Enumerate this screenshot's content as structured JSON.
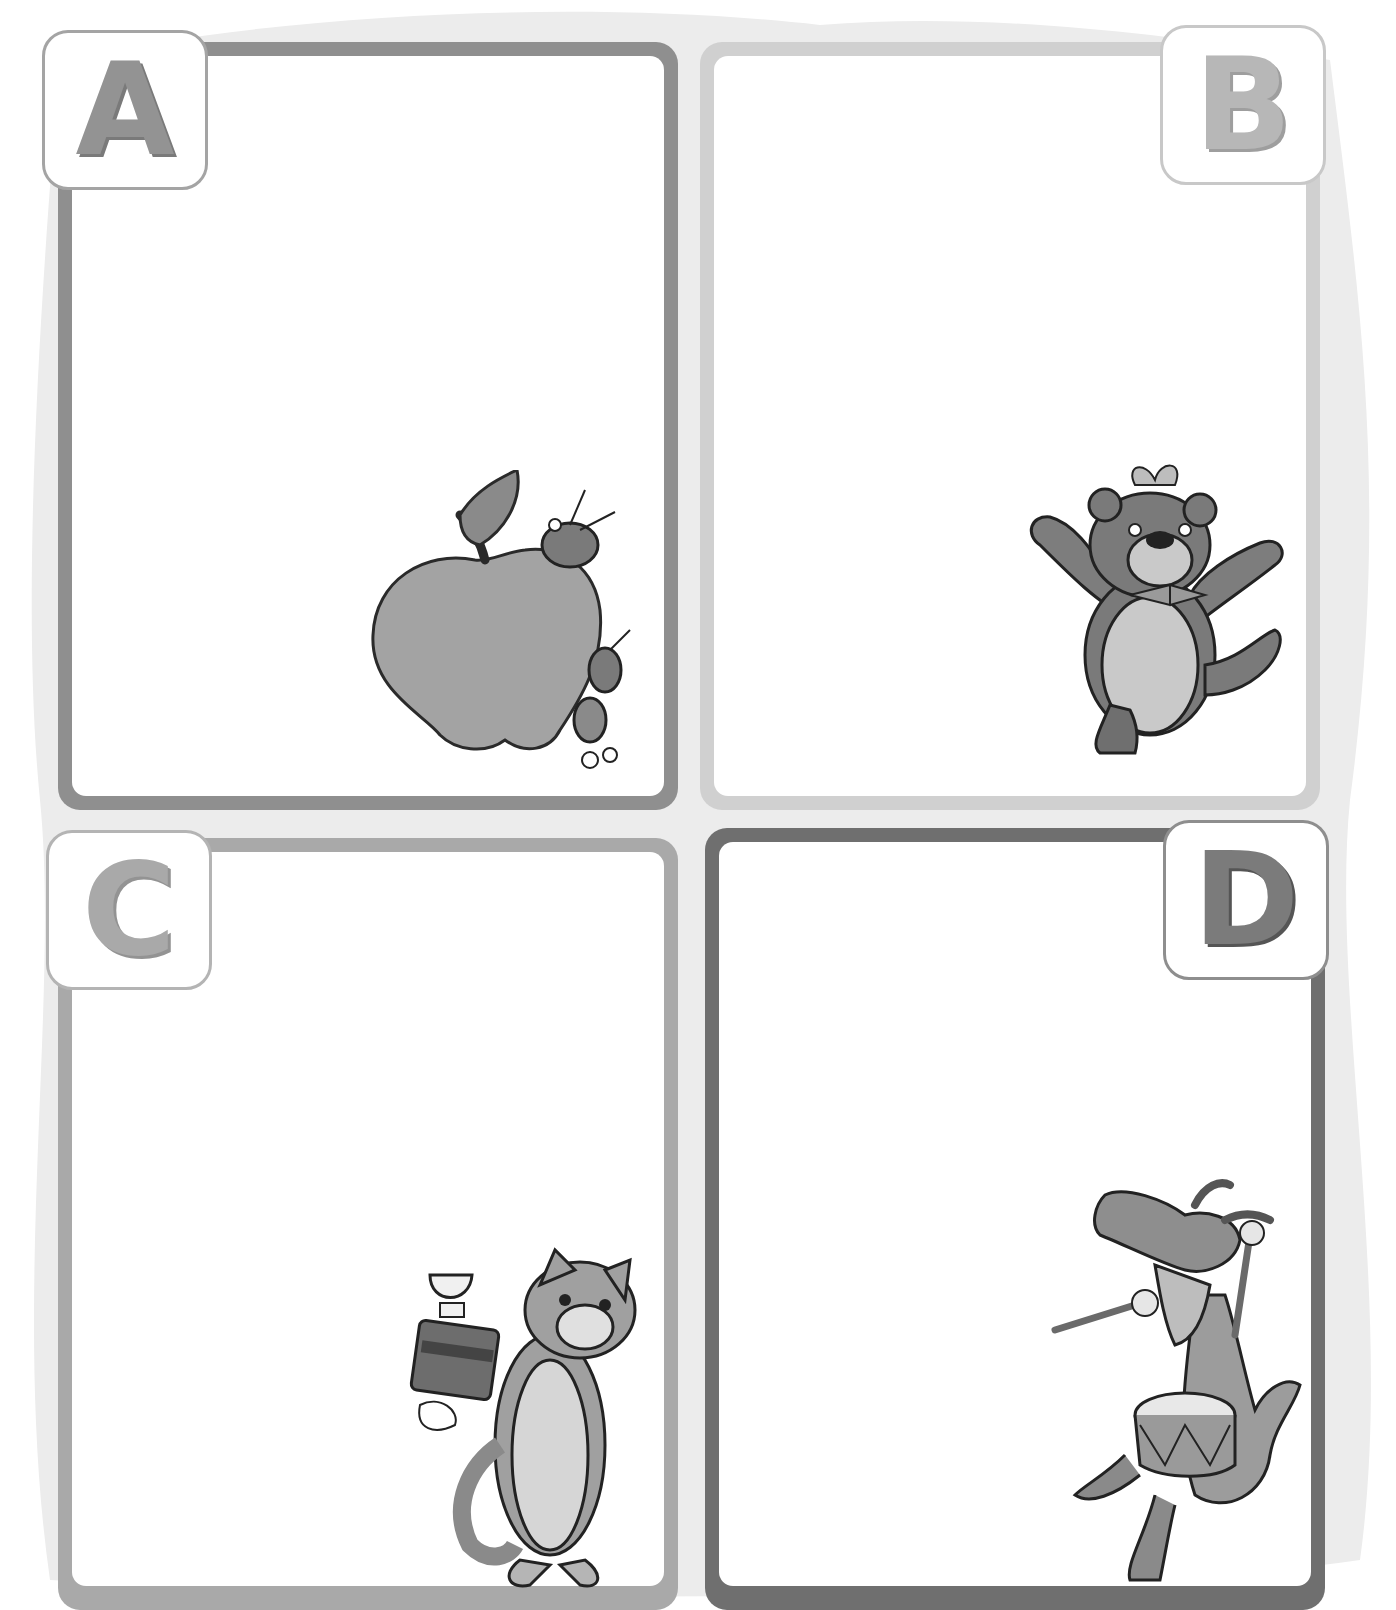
{
  "worksheet": {
    "background_color": "#ececec",
    "cards": [
      {
        "letter": "A",
        "subject": "apple with ants",
        "border_color": "#8f8f8f",
        "letter_color": "#939393",
        "badge_border": "#a4a4a4"
      },
      {
        "letter": "B",
        "subject": "bear with butterfly",
        "border_color": "#cfcfcf",
        "letter_color": "#b7b7b7",
        "badge_border": "#c8c8c8"
      },
      {
        "letter": "C",
        "subject": "cat with cake",
        "border_color": "#a9a9a9",
        "letter_color": "#a9a9a9",
        "badge_border": "#b4b4b4"
      },
      {
        "letter": "D",
        "subject": "dragon with drum",
        "border_color": "#6f6f6f",
        "letter_color": "#7b7b7b",
        "badge_border": "#8e8e8e"
      }
    ]
  }
}
